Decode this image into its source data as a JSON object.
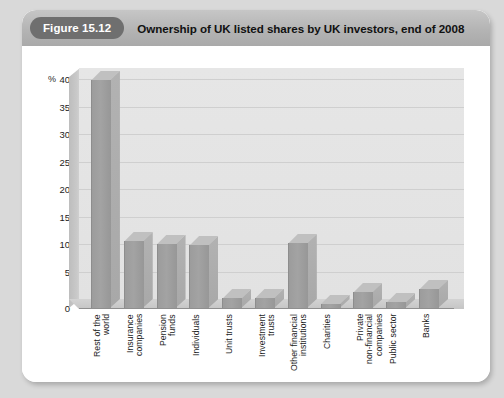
{
  "figure": {
    "badge_label": "Figure 15.12",
    "title": "Ownership of UK listed shares by UK investors, end of 2008"
  },
  "colors": {
    "page_background": "#d9d9d9",
    "card_background": "#ffffff",
    "header_band": "#b4b4b4",
    "badge_fill": "#6f6f6f",
    "badge_text": "#ffffff",
    "plot_background": "#e4e4e4",
    "gridline": "#cfcfcf",
    "bar_face": "#9c9c9c",
    "bar_top": "#c0c0c0",
    "bar_side": "#aeaeae",
    "side_wall": "#c5c5c5",
    "axis_text": "#1c1c1c"
  },
  "chart_data": {
    "type": "bar",
    "title": "Ownership of UK listed shares by UK investors, end of 2008",
    "xlabel": "",
    "ylabel": "%",
    "ylim": [
      0,
      42
    ],
    "yticks": [
      0,
      5,
      10,
      15,
      20,
      25,
      30,
      35,
      40
    ],
    "ytick_labels": [
      "0",
      "5",
      "10",
      "15",
      "20",
      "25",
      "30",
      "35",
      "40"
    ],
    "grid": true,
    "legend": "none",
    "units": "percent",
    "categories": [
      "Rest of the\nworld",
      "Insurance\ncompanies",
      "Pension\nfunds",
      "Individuals",
      "Unit trusts",
      "Investment\ntrusts",
      "Other financial\ninstitutions",
      "Charities",
      "Private\nnon-financial\ncompanies",
      "Public sector",
      "Banks"
    ],
    "values": [
      41.5,
      12.2,
      11.7,
      11.5,
      1.8,
      1.9,
      11.8,
      0.8,
      3.0,
      1.1,
      3.5
    ]
  }
}
